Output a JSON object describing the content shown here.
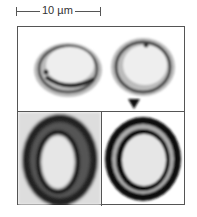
{
  "scale_bar": {
    "label": "10 µm"
  },
  "panels": [
    {
      "position": "top",
      "description": "two pollen grains, thin walls"
    },
    {
      "position": "bottom-left",
      "description": "pollen grain, thick dark wall, oval"
    },
    {
      "position": "bottom-right",
      "description": "pollen grain, thick dark concentric walls"
    }
  ],
  "colors": {
    "border": "#555555",
    "wall": "#1a1a1a",
    "interior": "#e8e8e8"
  }
}
